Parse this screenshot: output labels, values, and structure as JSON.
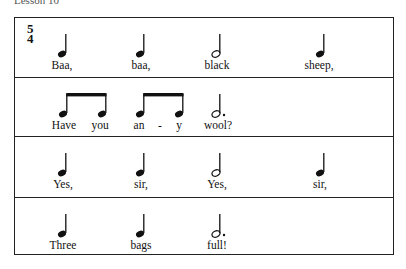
{
  "header": {
    "partial_text": "Lesson 10"
  },
  "time_signature": {
    "top": "5",
    "bottom": "4"
  },
  "lines": [
    {
      "notes": [
        {
          "type": "quarter",
          "x": 47
        },
        {
          "type": "quarter",
          "x": 125
        },
        {
          "type": "half",
          "x": 201
        },
        {
          "type": "quarter",
          "x": 305
        }
      ],
      "lyrics": [
        {
          "text": "Baa,",
          "x": 47
        },
        {
          "text": "baa,",
          "x": 126
        },
        {
          "text": "black",
          "x": 202
        },
        {
          "text": "sheep,",
          "x": 304
        }
      ]
    },
    {
      "notes": [
        {
          "type": "beamed-eighths",
          "x": 48,
          "x2": 87
        },
        {
          "type": "beamed-eighths",
          "x": 125,
          "x2": 164
        },
        {
          "type": "dotted-half",
          "x": 201
        }
      ],
      "lyrics": [
        {
          "text": "Have",
          "x": 49
        },
        {
          "text": "you",
          "x": 85
        },
        {
          "text": "an",
          "x": 124
        },
        {
          "text": "-",
          "x": 145
        },
        {
          "text": "y",
          "x": 164
        },
        {
          "text": "wool?",
          "x": 203
        }
      ]
    },
    {
      "notes": [
        {
          "type": "quarter",
          "x": 47
        },
        {
          "type": "quarter",
          "x": 125
        },
        {
          "type": "half",
          "x": 201
        },
        {
          "type": "quarter",
          "x": 305
        }
      ],
      "lyrics": [
        {
          "text": "Yes,",
          "x": 48
        },
        {
          "text": "sir,",
          "x": 126
        },
        {
          "text": "Yes,",
          "x": 202
        },
        {
          "text": "sir,",
          "x": 305
        }
      ]
    },
    {
      "notes": [
        {
          "type": "quarter",
          "x": 47
        },
        {
          "type": "quarter",
          "x": 125
        },
        {
          "type": "dotted-half",
          "x": 201
        }
      ],
      "lyrics": [
        {
          "text": "Three",
          "x": 48
        },
        {
          "text": "bags",
          "x": 126
        },
        {
          "text": "full!",
          "x": 202
        }
      ]
    }
  ]
}
